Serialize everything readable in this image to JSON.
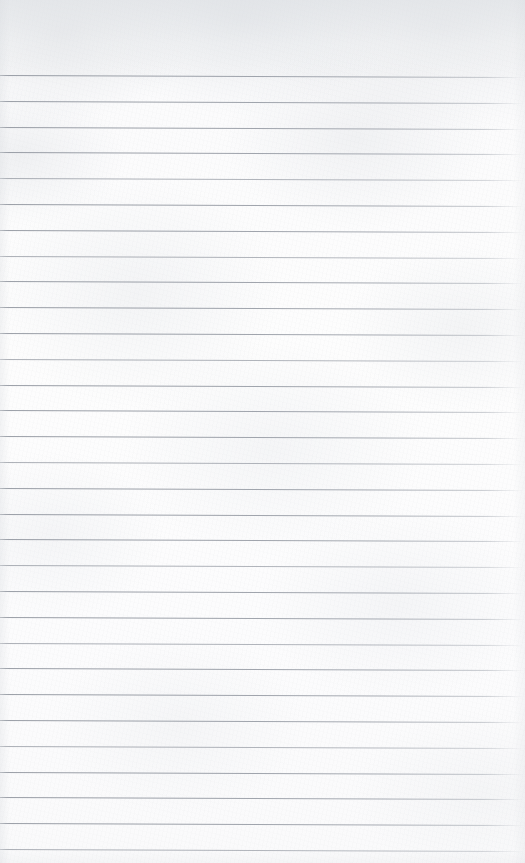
{
  "document": {
    "type": "scanned-ruled-paper",
    "title": "Blank lined notebook page",
    "content_text": "",
    "handwriting": "none",
    "printed_text": "none"
  },
  "page": {
    "width_px": 525,
    "height_px": 863,
    "background_color": "#fcfcfd",
    "paper_tone": "off-white",
    "texture": "subtle grey mottled scan grain"
  },
  "ruling": {
    "style": "wide ruled, horizontal only",
    "margin_rule": "none",
    "line_color": "#969ba3",
    "line_thickness_px": 1,
    "line_spacing_px": 25.8,
    "first_line_y_px": 75,
    "last_line_y_px": 848,
    "line_count": 31,
    "top_margin_px": 75,
    "skew_deg": 0.22,
    "right_edge_fade": "lines fade out near x=505",
    "line_positions_y": [
      75,
      100.8,
      126.6,
      152.4,
      178.2,
      204,
      229.8,
      255.6,
      281.4,
      307.2,
      333,
      358.8,
      384.6,
      410.4,
      436.2,
      462,
      487.8,
      513.6,
      539.4,
      565.2,
      591,
      616.8,
      642.6,
      668.4,
      694.2,
      720,
      745.8,
      771.6,
      797.4,
      823.2,
      849
    ],
    "line_weights": [
      "strong",
      "strong",
      "strong",
      "strong",
      "faint",
      "strong",
      "strong",
      "faint",
      "strong",
      "strong",
      "strong",
      "faint",
      "strong",
      "strong",
      "strong",
      "faint",
      "strong",
      "strong",
      "strong",
      "faint",
      "strong",
      "strong",
      "faint",
      "strong",
      "strong",
      "strong",
      "faint",
      "strong",
      "strong",
      "strong",
      "faint"
    ]
  }
}
